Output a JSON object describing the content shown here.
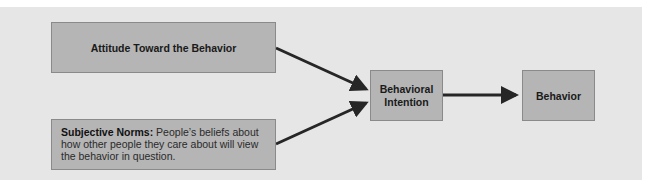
{
  "diagram": {
    "nodes": {
      "attitude": {
        "label": "Attitude Toward the Behavior"
      },
      "norms": {
        "term": "Subjective Norms:",
        "definition": " People’s beliefs about how other people they care about will view the behavior in question."
      },
      "intention": {
        "label_line1": "Behavioral",
        "label_line2": "Intention"
      },
      "behavior": {
        "label": "Behavior"
      }
    },
    "edges": [
      {
        "from": "attitude",
        "to": "intention"
      },
      {
        "from": "norms",
        "to": "intention"
      },
      {
        "from": "intention",
        "to": "behavior"
      }
    ],
    "colors": {
      "panel": "#e6e6e6",
      "box": "#b5b5b5",
      "arrow": "#262626"
    }
  }
}
